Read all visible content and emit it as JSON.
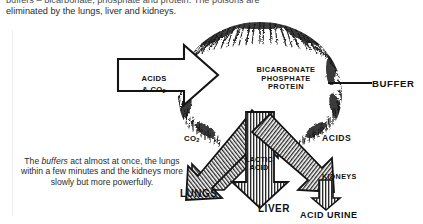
{
  "document": {
    "body_text": {
      "line1_prefix_italic": "buffers",
      "line1_rest": " – bicarbonate, phosphate and protein. The poisons are",
      "line2": "eliminated by the lungs, liver and kidneys."
    },
    "caption": {
      "part1": "The ",
      "italic": "buffers",
      "part2": " act almost at once, the lungs within a few minutes and the kidneys more slowly but more powerfully."
    }
  },
  "diagram": {
    "core": {
      "line1": "BICARBONATE",
      "line2": "PHOSPHATE",
      "line3": "PROTEIN"
    },
    "input_arrow": {
      "line1": "ACIDS",
      "line2": "& CO",
      "subscript": "2"
    },
    "pointer_label": "BUFFER",
    "outputs": [
      {
        "substance": "CO",
        "substance_sub": "2",
        "organ": "LUNGS"
      },
      {
        "substance_line1": "LACTIC",
        "substance_line2": "ACID",
        "organ": "LIVER"
      },
      {
        "substance": "ACIDS",
        "organ": "KIDNEYS",
        "product": "ACID  URINE"
      }
    ]
  },
  "colors": {
    "ink": "#111111",
    "text": "#2b2b2b",
    "faint_rule": "#efefef",
    "paper": "#ffffff"
  }
}
